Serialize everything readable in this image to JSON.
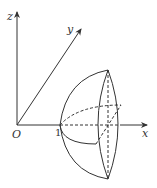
{
  "figure": {
    "axes": {
      "x_label": "x",
      "y_label": "y",
      "z_label": "z",
      "origin_label": "O",
      "tick_label": "1"
    },
    "colors": {
      "stroke": "#333333",
      "background": "#ffffff"
    }
  }
}
